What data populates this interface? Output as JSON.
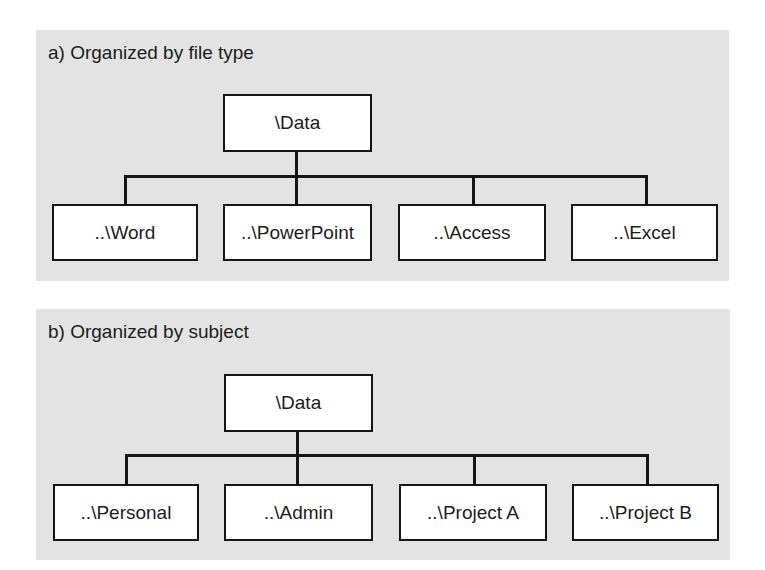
{
  "colors": {
    "panel_background": "#e3e3e3",
    "node_background": "#ffffff",
    "line": "#151515",
    "text": "#1c1c1c"
  },
  "diagrams": [
    {
      "title": "a) Organized by file type",
      "root": {
        "label": "\\Data"
      },
      "children": [
        {
          "label": "..\\Word"
        },
        {
          "label": "..\\PowerPoint"
        },
        {
          "label": "..\\Access"
        },
        {
          "label": "..\\Excel"
        }
      ]
    },
    {
      "title": "b) Organized by subject",
      "root": {
        "label": "\\Data"
      },
      "children": [
        {
          "label": "..\\Personal"
        },
        {
          "label": "..\\Admin"
        },
        {
          "label": "..\\Project A"
        },
        {
          "label": "..\\Project B"
        }
      ]
    }
  ]
}
